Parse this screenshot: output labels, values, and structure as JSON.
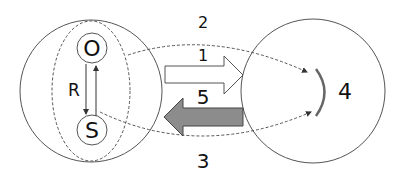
{
  "diagram": {
    "labels": {
      "o": "O",
      "s": "S",
      "r": "R",
      "arrow_top_dashed": "2",
      "arrow_white": "1",
      "arrow_gray": "5",
      "arrow_bottom_dashed": "3",
      "target": "4"
    },
    "colors": {
      "stroke": "#555555",
      "gray_arrow": "#8c8c8c",
      "arc": "#666666",
      "background": "#ffffff"
    }
  }
}
